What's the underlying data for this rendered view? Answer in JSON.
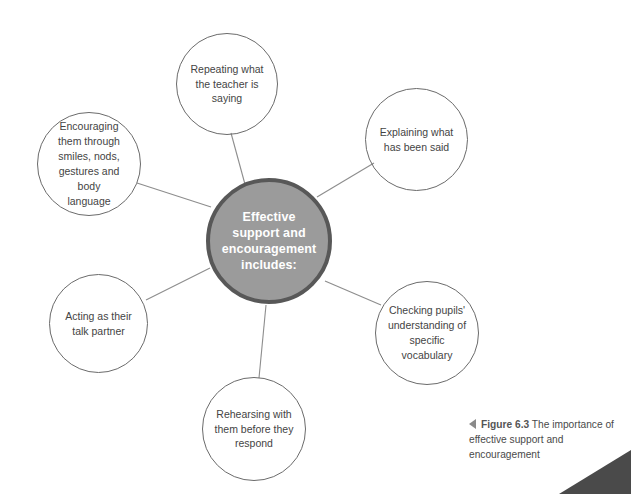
{
  "figure": {
    "hub": {
      "label": "Effective\nsupport and\nencouragement\nincludes:",
      "fill_color": "#9b9b9b",
      "border_color": "#585858",
      "text_color": "#ffffff"
    },
    "nodes": [
      {
        "id": "repeating-what-the-teacher-is-saying",
        "label": "Repeating what\nthe teacher is\nsaying"
      },
      {
        "id": "explaining-what-has-been-said",
        "label": "Explaining what\nhas been said"
      },
      {
        "id": "checking-pupils-understanding-of-specific-vocabulary",
        "label": "Checking pupils'\nunderstanding of\nspecific vocabulary"
      },
      {
        "id": "rehearsing-with-them-before-they-respond",
        "label": "Rehearsing with\nthem before they\nrespond"
      },
      {
        "id": "acting-as-their-talk-partner",
        "label": "Acting as their\ntalk partner"
      },
      {
        "id": "encouraging-them-through-smiles-nods-gestures-and-body-language",
        "label": "Encouraging\nthem through\nsmiles, nods,\ngestures and body\nlanguage"
      }
    ],
    "node_border_color": "#6b6b6b",
    "connector_color": "#8d8d8d",
    "background_color": "#ffffff"
  },
  "caption": {
    "figure_number": "Figure 6.3",
    "text": " The importance of effective support and encouragement",
    "marker_icon": "left-triangle-icon",
    "marker_color": "#8a8a8a"
  },
  "corner_wedge": {
    "icon": "corner-wedge-shape",
    "color": "#4a4a4a"
  }
}
